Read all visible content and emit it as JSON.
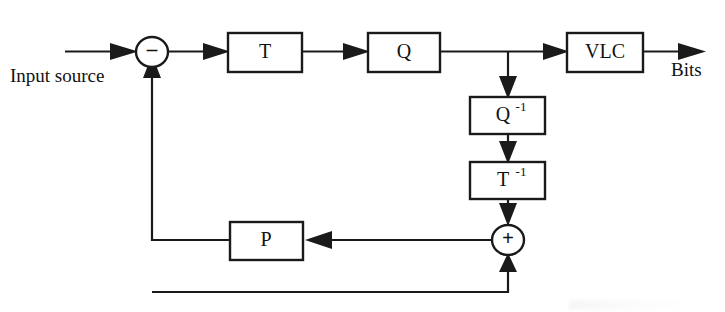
{
  "diagram": {
    "stroke_color": "#1a1a1a",
    "background_color": "#ffffff",
    "blocks": [
      {
        "id": "transform",
        "label": "T",
        "superscript": "",
        "x": 228,
        "y": 33,
        "w": 74,
        "h": 39
      },
      {
        "id": "quantizer",
        "label": "Q",
        "superscript": "",
        "x": 368,
        "y": 33,
        "w": 72,
        "h": 39
      },
      {
        "id": "vlc",
        "label": "VLC",
        "superscript": "",
        "x": 567,
        "y": 33,
        "w": 76,
        "h": 39
      },
      {
        "id": "inverse-quantizer",
        "label": "Q",
        "superscript": "-1",
        "x": 470,
        "y": 97,
        "w": 75,
        "h": 37
      },
      {
        "id": "inverse-transform",
        "label": "T",
        "superscript": "-1",
        "x": 470,
        "y": 162,
        "w": 75,
        "h": 37
      },
      {
        "id": "predictor",
        "label": "P",
        "superscript": "",
        "x": 230,
        "y": 222,
        "w": 73,
        "h": 38
      }
    ],
    "nodes": [
      {
        "id": "subtractor",
        "sign": "–",
        "cx": 152,
        "cy": 52,
        "rx": 16,
        "ry": 15
      },
      {
        "id": "adder",
        "sign": "+",
        "cx": 508,
        "cy": 240,
        "rx": 16,
        "ry": 15
      }
    ],
    "labels": [
      {
        "id": "input-source-label",
        "text": "Input source",
        "x": 10,
        "y": 78
      },
      {
        "id": "bits-label",
        "text": "Bits",
        "x": 671,
        "y": 72
      }
    ],
    "connections": [
      {
        "id": "input-to-subtractor",
        "from": "input",
        "to": "subtractor"
      },
      {
        "id": "subtractor-to-transform",
        "from": "subtractor",
        "to": "transform"
      },
      {
        "id": "transform-to-quantizer",
        "from": "transform",
        "to": "quantizer"
      },
      {
        "id": "quantizer-to-vlc",
        "from": "quantizer",
        "to": "vlc"
      },
      {
        "id": "vlc-to-bits",
        "from": "vlc",
        "to": "bits"
      },
      {
        "id": "quantizer-tap-to-inverse-q",
        "from": "quantizer-tap",
        "to": "inverse-quantizer"
      },
      {
        "id": "inverse-q-to-inverse-t",
        "from": "inverse-quantizer",
        "to": "inverse-transform"
      },
      {
        "id": "inverse-t-to-adder",
        "from": "inverse-transform",
        "to": "adder"
      },
      {
        "id": "adder-to-predictor",
        "from": "adder",
        "to": "predictor"
      },
      {
        "id": "predictor-to-subtractor",
        "from": "predictor",
        "to": "subtractor"
      },
      {
        "id": "subtractor-branch-to-adder",
        "from": "prediction-branch",
        "to": "adder"
      }
    ]
  }
}
